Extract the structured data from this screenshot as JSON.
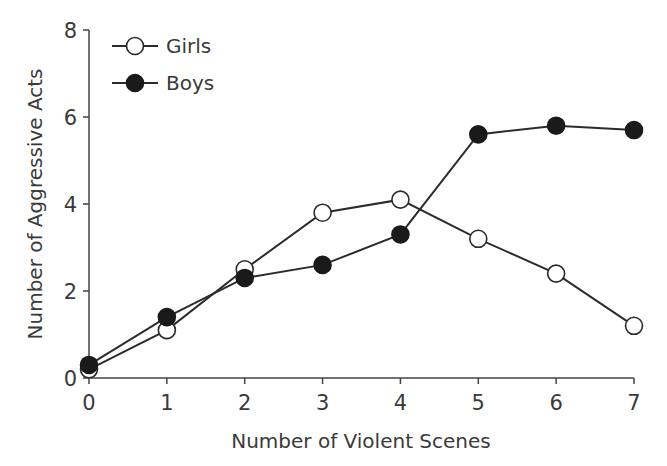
{
  "chart_data": {
    "type": "line",
    "title": "",
    "xlabel": "Number of Violent Scenes",
    "ylabel": "Number of Aggressive Acts",
    "x": [
      0,
      1,
      2,
      3,
      4,
      5,
      6,
      7
    ],
    "xticks": [
      "0",
      "1",
      "2",
      "3",
      "4",
      "5",
      "6",
      "7"
    ],
    "yticks": [
      "0",
      "2",
      "4",
      "6",
      "8"
    ],
    "xlim": [
      0,
      7
    ],
    "ylim": [
      0,
      8
    ],
    "grid": false,
    "legend_position": "upper left",
    "series": [
      {
        "name": "Girls",
        "marker": "open-circle",
        "values": [
          0.2,
          1.1,
          2.5,
          3.8,
          4.1,
          3.2,
          2.4,
          1.2
        ]
      },
      {
        "name": "Boys",
        "marker": "filled-circle",
        "values": [
          0.3,
          1.4,
          2.3,
          2.6,
          3.3,
          5.6,
          5.8,
          5.7
        ]
      }
    ]
  },
  "colors": {
    "line": "#2b2b2b",
    "axis": "#444444",
    "text": "#3a3a3a",
    "filled_marker": "#1a1a1a",
    "open_marker": "#ffffff"
  }
}
